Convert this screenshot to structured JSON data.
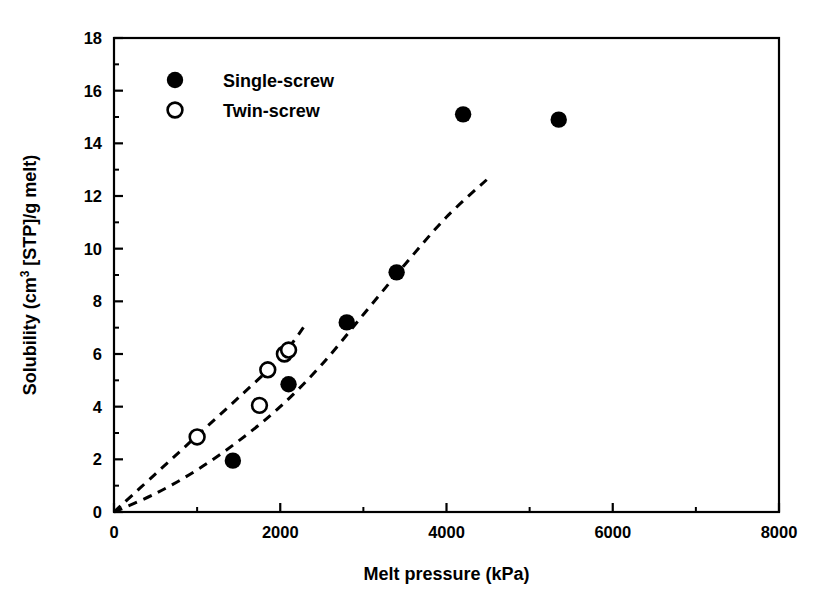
{
  "chart_data": {
    "type": "scatter",
    "title": "",
    "xlabel": "Melt pressure (kPa)",
    "ylabel": "Solubility (cm3 [STP]/g melt)",
    "ylabel_parts": {
      "prefix": "Solubility (cm",
      "superscript": "3",
      "suffix": " [STP]/g melt)"
    },
    "xlim": [
      0,
      8000
    ],
    "ylim": [
      0,
      18
    ],
    "xticks": [
      0,
      2000,
      4000,
      6000,
      8000
    ],
    "xtick_labels": [
      "0",
      "2000",
      "4000",
      "6000",
      "8000"
    ],
    "yticks": [
      0,
      2,
      4,
      6,
      8,
      10,
      12,
      14,
      16,
      18
    ],
    "ytick_labels": [
      "0",
      "2",
      "4",
      "6",
      "8",
      "10",
      "12",
      "14",
      "16",
      "18"
    ],
    "x_minor_ticks": [
      1000,
      3000,
      5000,
      7000
    ],
    "y_minor_ticks": [
      1,
      3,
      5,
      7,
      9,
      11,
      13,
      15,
      17
    ],
    "grid": false,
    "legend_position": "top-left",
    "frame": "box",
    "series": [
      {
        "name": "Single-screw",
        "marker": "filled-circle",
        "color": "#000000",
        "points": [
          {
            "x": 1430,
            "y": 1.95
          },
          {
            "x": 2100,
            "y": 4.85
          },
          {
            "x": 2800,
            "y": 7.2
          },
          {
            "x": 3400,
            "y": 9.1
          },
          {
            "x": 4200,
            "y": 15.1
          },
          {
            "x": 5350,
            "y": 14.9
          }
        ]
      },
      {
        "name": "Twin-screw",
        "marker": "open-circle",
        "color": "#000000",
        "points": [
          {
            "x": 1000,
            "y": 2.85
          },
          {
            "x": 1750,
            "y": 4.05
          },
          {
            "x": 1850,
            "y": 5.4
          },
          {
            "x": 2050,
            "y": 6.0
          },
          {
            "x": 2100,
            "y": 6.15
          }
        ]
      }
    ],
    "trend_lines": [
      {
        "name": "twin-screw-trend",
        "style": "dashed",
        "color": "#000000",
        "points": [
          {
            "x": 0,
            "y": 0
          },
          {
            "x": 500,
            "y": 1.45
          },
          {
            "x": 1000,
            "y": 2.9
          },
          {
            "x": 1500,
            "y": 4.35
          },
          {
            "x": 2000,
            "y": 5.85
          },
          {
            "x": 2300,
            "y": 7.1
          }
        ]
      },
      {
        "name": "single-screw-trend",
        "style": "dashed",
        "color": "#000000",
        "points": [
          {
            "x": 0,
            "y": 0
          },
          {
            "x": 500,
            "y": 0.7
          },
          {
            "x": 1000,
            "y": 1.6
          },
          {
            "x": 1500,
            "y": 2.7
          },
          {
            "x": 2000,
            "y": 4.0
          },
          {
            "x": 2500,
            "y": 5.6
          },
          {
            "x": 3000,
            "y": 7.5
          },
          {
            "x": 3500,
            "y": 9.4
          },
          {
            "x": 4000,
            "y": 11.2
          },
          {
            "x": 4530,
            "y": 12.75
          }
        ]
      }
    ],
    "legend": [
      {
        "marker": "filled-circle",
        "label": "Single-screw"
      },
      {
        "marker": "open-circle",
        "label": "Twin-screw"
      }
    ]
  }
}
